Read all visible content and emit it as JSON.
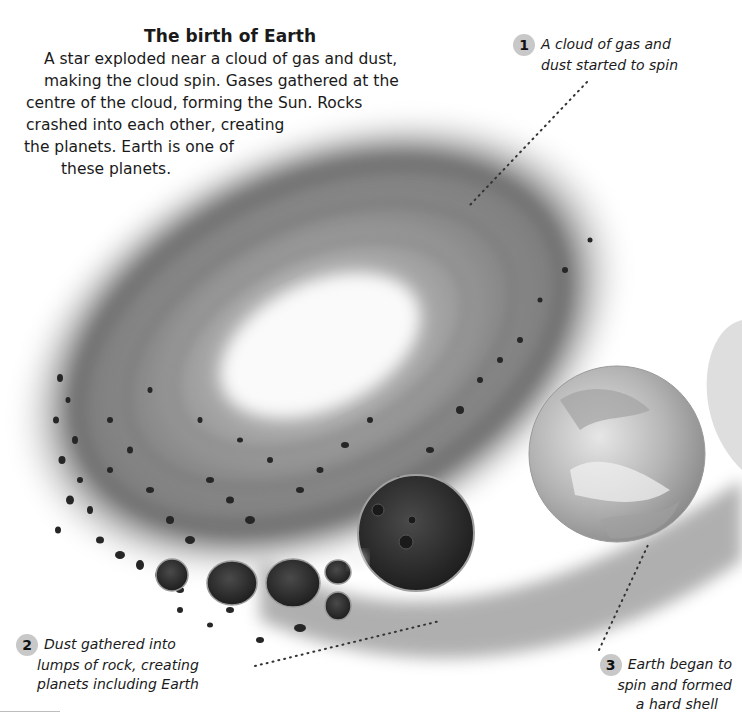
{
  "heading": "The birth of Earth",
  "intro_lines": [
    "A star exploded near a cloud of gas and dust,",
    "making the cloud spin. Gases gathered at the",
    "centre of the cloud, forming the Sun. Rocks",
    "crashed into each other, creating",
    "the planets. Earth is one of",
    "these planets."
  ],
  "callouts": [
    {
      "number": "1",
      "lines": [
        "A cloud of gas and",
        "dust started to spin"
      ]
    },
    {
      "number": "2",
      "lines": [
        "Dust gathered into",
        "lumps of rock, creating",
        "planets including Earth"
      ]
    },
    {
      "number": "3",
      "lines": [
        "Earth began to",
        "spin and formed",
        "a hard shell"
      ]
    }
  ],
  "illustration": {
    "subject": "swirling-gas-dust-cloud-with-forming-planets",
    "palette": {
      "background": "#ffffff",
      "cloud_light": "#f4f4f4",
      "cloud_mid": "#9a9a9a",
      "cloud_dark": "#5a5a5a",
      "rock": "#2a2a2a",
      "earth": "#bdbdbd"
    }
  }
}
